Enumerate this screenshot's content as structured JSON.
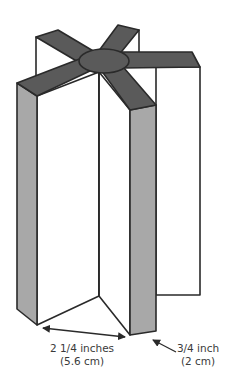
{
  "diagram": {
    "colors": {
      "background": "#ffffff",
      "arm_fill": "#5a5a5a",
      "column_side_fill": "#a8a8a8",
      "panel_fill": "#ffffff",
      "stroke": "#2a2a2a",
      "label_text": "#3a3a3a"
    },
    "dimensions": [
      {
        "id": "panel-width",
        "line1": "2 1/4 inches",
        "line2": "(5.6 cm)"
      },
      {
        "id": "arm-thickness",
        "line1": "3/4 inch",
        "line2": "(2 cm)"
      }
    ]
  }
}
